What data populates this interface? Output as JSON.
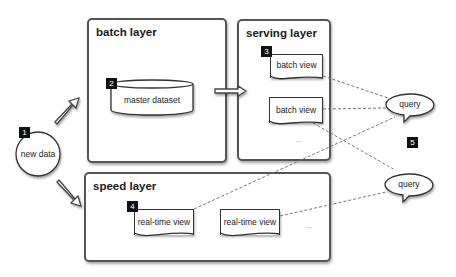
{
  "diagram": {
    "type": "lambda-architecture",
    "layers": {
      "batch": {
        "title": "batch layer"
      },
      "serving": {
        "title": "serving layer"
      },
      "speed": {
        "title": "speed layer"
      }
    },
    "nodes": {
      "new_data": {
        "label": "new data",
        "badge": "1"
      },
      "master_dataset": {
        "label": "master dataset",
        "badge": "2"
      },
      "batch_view_1": {
        "label": "batch view",
        "badge": "3"
      },
      "batch_view_2": {
        "label": "batch view"
      },
      "serving_more": {
        "label": "..."
      },
      "realtime_view_1": {
        "label": "real-time view",
        "badge": "4"
      },
      "realtime_view_2": {
        "label": "real-time view"
      },
      "speed_more": {
        "label": "..."
      },
      "query_1": {
        "label": "query"
      },
      "query_2": {
        "label": "query"
      },
      "step5": {
        "badge": "5"
      }
    },
    "edges": [
      {
        "from": "new_data",
        "to": "batch_layer",
        "style": "block-arrow"
      },
      {
        "from": "new_data",
        "to": "speed_layer",
        "style": "block-arrow"
      },
      {
        "from": "batch_layer",
        "to": "serving_layer",
        "style": "block-arrow"
      },
      {
        "from": "batch_view_1",
        "to": "query_1",
        "style": "dashed"
      },
      {
        "from": "batch_view_2",
        "to": "query_1",
        "style": "dashed"
      },
      {
        "from": "batch_view_2",
        "to": "query_2",
        "style": "dashed"
      },
      {
        "from": "realtime_view_1",
        "to": "query_1",
        "style": "dashed"
      },
      {
        "from": "realtime_view_2",
        "to": "query_2",
        "style": "dashed"
      }
    ]
  }
}
